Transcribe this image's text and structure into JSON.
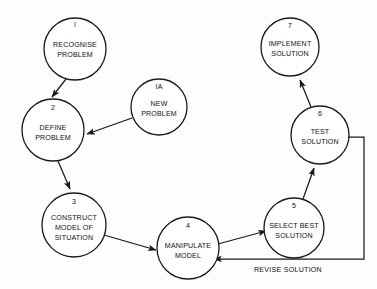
{
  "diagram": {
    "background_color": "#fdfdfc",
    "line_color": "#1a1a1a",
    "text_color": "#111111",
    "nodes": [
      {
        "id": "node-1",
        "number": "I",
        "lines": [
          "RECOGNISE",
          "PROBLEM"
        ],
        "cx": 75,
        "cy": 49,
        "r": 31
      },
      {
        "id": "node-1a",
        "number": "IA",
        "lines": [
          "NEW",
          "PROBLEM"
        ],
        "cx": 159,
        "cy": 107,
        "r": 28
      },
      {
        "id": "node-2",
        "number": "2",
        "lines": [
          "DEFINE",
          "PROBLEM"
        ],
        "cx": 53,
        "cy": 130,
        "r": 31
      },
      {
        "id": "node-3",
        "number": "3",
        "lines": [
          "CONSTRUCT",
          "MODEL OF",
          "SITUATION"
        ],
        "cx": 74,
        "cy": 225,
        "r": 32
      },
      {
        "id": "node-4",
        "number": "4",
        "lines": [
          "MANIPULATE",
          "MODEL"
        ],
        "cx": 188,
        "cy": 248,
        "r": 31
      },
      {
        "id": "node-5",
        "number": "5",
        "lines": [
          "SELECT BEST",
          "SOLUTION"
        ],
        "cx": 294,
        "cy": 228,
        "r": 30
      },
      {
        "id": "node-6",
        "number": "6",
        "lines": [
          "TEST",
          "SOLUTION"
        ],
        "cx": 320,
        "cy": 135,
        "r": 29
      },
      {
        "id": "node-7",
        "number": "7",
        "lines": [
          "IMPLEMENT",
          "SOLUTION"
        ],
        "cx": 290,
        "cy": 47,
        "r": 29
      }
    ],
    "edges": [
      {
        "id": "edge-1-to-2",
        "from": "node-1",
        "to": "node-2",
        "label": ""
      },
      {
        "id": "edge-1a-to-2",
        "from": "node-1a",
        "to": "node-2",
        "label": ""
      },
      {
        "id": "edge-2-to-3",
        "from": "node-2",
        "to": "node-3",
        "label": ""
      },
      {
        "id": "edge-3-to-4",
        "from": "node-3",
        "to": "node-4",
        "label": ""
      },
      {
        "id": "edge-4-to-5",
        "from": "node-4",
        "to": "node-5",
        "label": ""
      },
      {
        "id": "edge-5-to-6",
        "from": "node-5",
        "to": "node-6",
        "label": ""
      },
      {
        "id": "edge-6-to-7",
        "from": "node-6",
        "to": "node-7",
        "label": ""
      },
      {
        "id": "edge-6-to-4-revise",
        "from": "node-6",
        "to": "node-4",
        "label": "REVISE SOLUTION"
      }
    ],
    "edge_labels": {
      "revise_solution": "REVISE SOLUTION"
    }
  }
}
